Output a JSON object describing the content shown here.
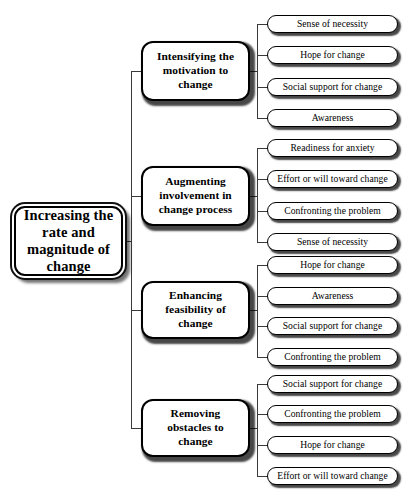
{
  "diagram": {
    "type": "tree",
    "orientation": "left-to-right",
    "title": "Increasing the rate and magnitude of change",
    "root": {
      "label": "Increasing the rate and magnitude of change"
    },
    "branches": [
      {
        "label": "Intensifying the motivation to change",
        "leaves": [
          "Sense of necessity",
          "Hope for change",
          "Social support for change",
          "Awareness"
        ]
      },
      {
        "label": "Augmenting involvement in change process",
        "leaves": [
          "Readiness for anxiety",
          "Effort or will toward change",
          "Confronting the problem",
          "Sense of necessity"
        ]
      },
      {
        "label": "Enhancing feasibility of change",
        "leaves": [
          "Hope for change",
          "Awareness",
          "Social support for change",
          "Confronting the problem"
        ]
      },
      {
        "label": "Removing obstacles to change",
        "leaves": [
          "Social support for change",
          "Confronting the problem",
          "Hope for change",
          "Effort or will toward change"
        ]
      }
    ],
    "colors": {
      "background": "#ffffff",
      "stroke": "#000000",
      "connector": "#3a3a3a",
      "text": "#000000",
      "shadow": "rgba(0,0,0,0.72)"
    }
  }
}
